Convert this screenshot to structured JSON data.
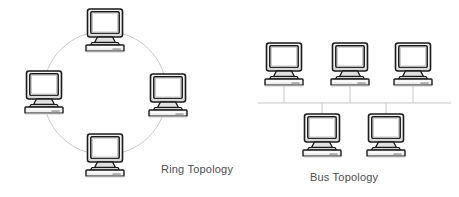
{
  "diagram": {
    "background_color": "#ffffff",
    "width": 459,
    "height": 197,
    "line_color": "#c8c8c8",
    "icon_outline_color": "#1a1a1a",
    "icon_screen_color": "#ffffff",
    "icon_body_color": "#e8e8e8",
    "label_color": "#4d4d4d"
  },
  "ring": {
    "label": "Ring Topology",
    "icon_name": "crt-computer-icon",
    "circle": {
      "cx": 105,
      "cy": 93,
      "r": 62
    },
    "nodes": [
      {
        "name": "ring-node-top",
        "position": "top",
        "x": 105,
        "y": 31
      },
      {
        "name": "ring-node-left",
        "position": "left",
        "x": 44,
        "y": 93
      },
      {
        "name": "ring-node-right",
        "position": "right",
        "x": 168,
        "y": 96
      },
      {
        "name": "ring-node-bottom",
        "position": "bottom",
        "x": 105,
        "y": 156
      }
    ]
  },
  "bus": {
    "label": "Bus Topology",
    "icon_name": "crt-computer-icon",
    "backbone": {
      "x1": 258,
      "x2": 451,
      "y": 103
    },
    "nodes": [
      {
        "name": "bus-node-top-left",
        "row": "top",
        "x": 284,
        "y": 65,
        "drop_x": 284,
        "drop_from": 87,
        "drop_to": 103
      },
      {
        "name": "bus-node-top-center",
        "row": "top",
        "x": 350,
        "y": 65,
        "drop_x": 350,
        "drop_from": 87,
        "drop_to": 103
      },
      {
        "name": "bus-node-top-right",
        "row": "top",
        "x": 413,
        "y": 65,
        "drop_x": 413,
        "drop_from": 87,
        "drop_to": 103
      },
      {
        "name": "bus-node-bottom-left",
        "row": "bottom",
        "x": 322,
        "y": 136,
        "drop_x": 322,
        "drop_from": 103,
        "drop_to": 118
      },
      {
        "name": "bus-node-bottom-right",
        "row": "bottom",
        "x": 386,
        "y": 136,
        "drop_x": 386,
        "drop_from": 103,
        "drop_to": 118
      }
    ]
  }
}
